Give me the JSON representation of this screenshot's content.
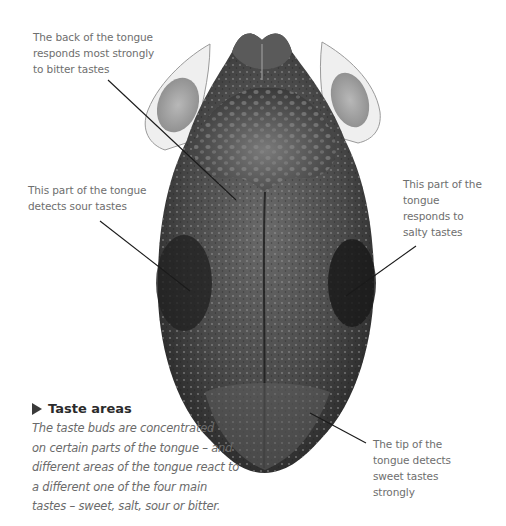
{
  "figure": {
    "labels": {
      "bitter": "The back of the tongue\nresponds most strongly\nto bitter tastes",
      "sour": "This part of the tongue\ndetects sour tastes",
      "salty": "This part of the\ntongue\nresponds to\nsalty tastes",
      "sweet": "The tip of the\ntongue detects\nsweet tastes\nstrongly"
    },
    "caption": {
      "heading": "Taste areas",
      "heading_icon": "triangle-right-icon",
      "body": "The taste buds are concentrated\non certain parts of the tongue – and\ndifferent areas of the tongue react to\na different one of the four main\ntastes – sweet, salt, sour or bitter."
    },
    "colors": {
      "label_text": "#6e6e6e",
      "caption_heading": "#2b2b2b",
      "caption_body": "#6a6a6a",
      "leader_line": "#1a1a1a",
      "tongue_dark": "#2a2a2a",
      "tongue_mid": "#555555",
      "background": "#ffffff"
    }
  }
}
